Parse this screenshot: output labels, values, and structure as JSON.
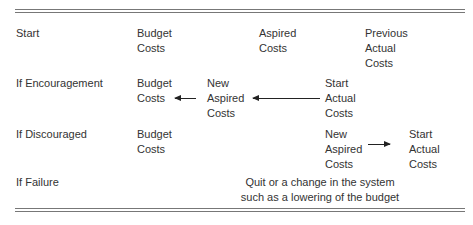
{
  "rows": [
    {
      "label": "Start",
      "cells": [
        {
          "lines": [
            "Budget",
            "Costs"
          ]
        },
        {
          "lines": [
            "Aspired",
            "Costs"
          ]
        },
        {
          "lines": [
            "Previous",
            "Actual",
            "Costs"
          ]
        }
      ]
    },
    {
      "label": "If Encouragement",
      "cells": [
        {
          "lines": [
            "Budget",
            "Costs"
          ]
        },
        {
          "lines": [
            "New",
            "Aspired",
            "Costs"
          ]
        },
        {
          "lines": [
            "Start",
            "Actual",
            "Costs"
          ]
        }
      ],
      "arrows": [
        "left",
        "left"
      ]
    },
    {
      "label": "If Discouraged",
      "cells": [
        {
          "lines": [
            "Budget",
            "Costs"
          ]
        },
        {
          "lines": [
            "New",
            "Aspired",
            "Costs"
          ]
        },
        {
          "lines": [
            "Start",
            "Actual",
            "Costs"
          ]
        }
      ],
      "arrows": [
        "right"
      ]
    },
    {
      "label": "If Failure",
      "note": [
        "Quit or a change in the system",
        "such as a lowering of the budget"
      ]
    }
  ]
}
